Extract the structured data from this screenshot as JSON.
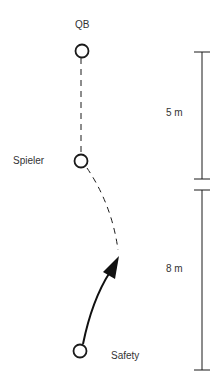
{
  "diagram": {
    "type": "football-play-diagram",
    "players": [
      {
        "id": "qb",
        "label": "QB",
        "x": 82,
        "y": 51
      },
      {
        "id": "spieler",
        "label": "Spieler",
        "x": 81,
        "y": 161
      },
      {
        "id": "safety",
        "label": "Safety",
        "x": 80,
        "y": 351
      }
    ],
    "paths": [
      {
        "from": "qb",
        "to": "spieler",
        "style": "dashed"
      },
      {
        "from": "spieler",
        "to": "end",
        "style": "dashed-curve"
      },
      {
        "from": "safety",
        "to": "arrowhead",
        "style": "solid-arrow"
      }
    ],
    "distances": [
      {
        "label": "5 m",
        "from_y": 52,
        "to_y": 179
      },
      {
        "label": "8 m",
        "from_y": 190,
        "to_y": 370
      }
    ],
    "colors": {
      "line": "#1a1a1a",
      "text": "#333333",
      "background": "#ffffff"
    }
  }
}
